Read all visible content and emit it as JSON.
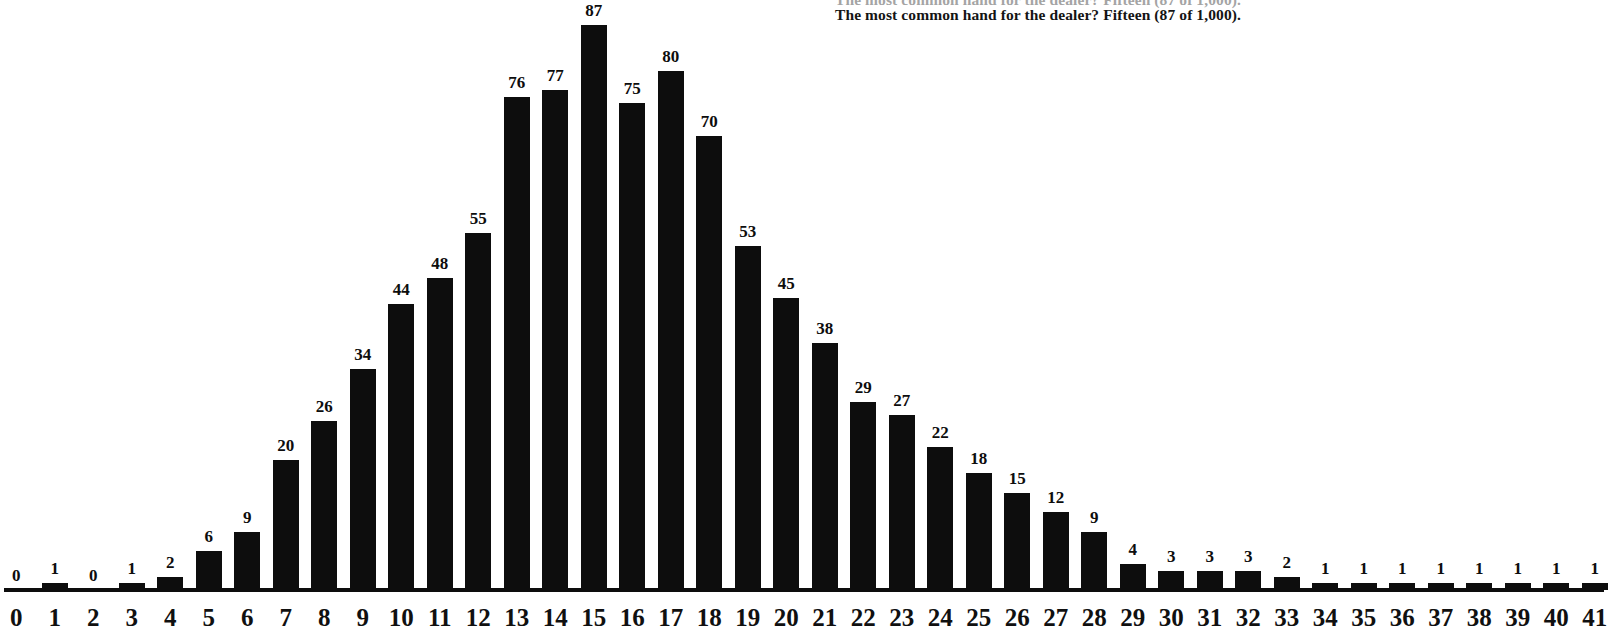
{
  "headline": {
    "text": "The most common hand for the dealer? Fifteen (87 of 1,000).",
    "clipped_above_text": "The most common hand for the dealer? Fifteen (87 of 1,000)."
  },
  "colors": {
    "background": "#ffffff",
    "bar": "#0d0d0d",
    "text": "#111111",
    "axis": "#0d0d0d"
  },
  "chart_data": {
    "type": "bar",
    "title": "The most common hand for the dealer? Fifteen (87 of 1,000).",
    "xlabel": "",
    "ylabel": "",
    "grid": false,
    "legend": "none",
    "ylim": [
      0,
      87
    ],
    "value_labels_shown": true,
    "categories": [
      "0",
      "1",
      "2",
      "3",
      "4",
      "5",
      "6",
      "7",
      "8",
      "9",
      "10",
      "11",
      "12",
      "13",
      "14",
      "15",
      "16",
      "17",
      "18",
      "19",
      "20",
      "21",
      "22",
      "23",
      "24",
      "25",
      "26",
      "27",
      "28",
      "29",
      "30",
      "31",
      "32",
      "33",
      "34",
      "35",
      "36",
      "37",
      "38",
      "39",
      "40",
      "41"
    ],
    "values": [
      0,
      1,
      0,
      1,
      2,
      6,
      9,
      20,
      26,
      34,
      44,
      48,
      55,
      76,
      77,
      87,
      75,
      80,
      70,
      53,
      45,
      38,
      29,
      27,
      22,
      18,
      15,
      12,
      9,
      4,
      3,
      3,
      3,
      2,
      1,
      1,
      1,
      1,
      1,
      1,
      1,
      1
    ],
    "total": 1000,
    "peak_category": "15",
    "peak_value": 87
  }
}
